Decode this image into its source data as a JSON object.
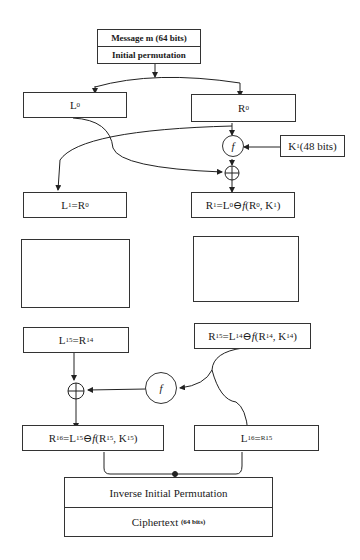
{
  "diagram": {
    "top": {
      "message": "Message m (64 bits)",
      "initial_permutation": "Initial permutation"
    },
    "round0": {
      "left": {
        "base": "L",
        "sub": "0"
      },
      "right": {
        "base": "R",
        "sub": "0"
      }
    },
    "round1": {
      "f_symbol": "f",
      "key": {
        "base": "K",
        "sub": "1",
        "suffix": " (48 bits)"
      },
      "left_eq": {
        "lhs": "L",
        "lhs_sub": "1",
        "op": " = ",
        "rhs": "R",
        "rhs_sub": "0"
      },
      "right_eq": {
        "lhs": "R",
        "lhs_sub": "1",
        "op": " = ",
        "a": "L",
        "a_sub": "0",
        "xor": " ⊖ ",
        "f": "f",
        "args_open": "(R",
        "args_sub1": "0",
        "comma": ", K",
        "args_sub2": "1",
        "close": ")"
      }
    },
    "ellipsis": {
      "left": "⋮",
      "right": "⋮"
    },
    "round15": {
      "left_eq": {
        "lhs": "L",
        "lhs_sub": "15",
        "op": " = ",
        "rhs": "R",
        "rhs_sub": "14"
      },
      "right_eq": {
        "lhs": "R",
        "lhs_sub": "15",
        "op": " = ",
        "a": "L",
        "a_sub": "14",
        "xor": " ⊖ ",
        "f": "f",
        "args_open": "(R",
        "args_sub1": "14",
        "comma": ", K",
        "args_sub2": "14",
        "close": ")"
      },
      "f_symbol": "f"
    },
    "round16": {
      "left_eq": {
        "lhs": "R",
        "lhs_sub": "16",
        "op": " = ",
        "a": "L",
        "a_sub": "15",
        "xor": " ⊖ ",
        "f": "f",
        "args_open": "(R",
        "args_sub1": "15",
        "comma": ", K",
        "args_sub2": "15",
        "close": ")"
      },
      "right_eq": {
        "lhs": "L",
        "lhs_sub": "16",
        "op": " = ",
        "rhs_sup": "R15"
      }
    },
    "bottom": {
      "inverse_permutation": "Inverse Initial Permutation",
      "ciphertext": "Ciphertext",
      "ciphertext_bits": "(64 bits)"
    }
  }
}
